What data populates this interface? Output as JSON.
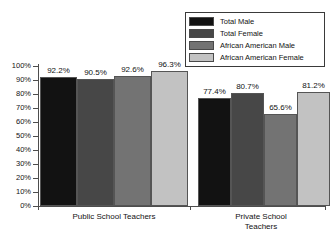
{
  "chart_data": {
    "type": "bar",
    "title": "",
    "subtitle": "",
    "xlabel": "",
    "ylabel": "",
    "ylim": [
      0,
      100
    ],
    "ytick_labels": [
      "100%",
      "90%",
      "80%",
      "70%",
      "60%",
      "50%",
      "40%",
      "30%",
      "20%",
      "10%",
      "0%"
    ],
    "ytick_values": [
      100,
      90,
      80,
      70,
      60,
      50,
      40,
      30,
      20,
      10,
      0
    ],
    "grid": false,
    "legend_position": "top-right",
    "categories": [
      "Public School Teachers",
      "Private School\nTeachers"
    ],
    "series": [
      {
        "name": "Total Male",
        "color": "#121212",
        "values": [
          92.2,
          77.4
        ],
        "labels": [
          "92.2%",
          "77.4%"
        ]
      },
      {
        "name": "Total Female",
        "color": "#474747",
        "values": [
          90.5,
          80.7
        ],
        "labels": [
          "90.5%",
          "80.7%"
        ]
      },
      {
        "name": "African American Male",
        "color": "#737373",
        "values": [
          92.6,
          65.6
        ],
        "labels": [
          "92.6%",
          "65.6%"
        ]
      },
      {
        "name": "African American Female",
        "color": "#c2c2c2",
        "values": [
          96.3,
          81.2
        ],
        "labels": [
          "96.3%",
          "81.2%"
        ]
      }
    ]
  },
  "legend": {
    "items": [
      {
        "label": "Total Male",
        "color": "#121212"
      },
      {
        "label": "Total Female",
        "color": "#474747"
      },
      {
        "label": "African American Male",
        "color": "#737373"
      },
      {
        "label": "African American Female",
        "color": "#c2c2c2"
      }
    ]
  },
  "axis": {
    "y_labels": [
      "100%",
      "90%",
      "80%",
      "70%",
      "60%",
      "50%",
      "40%",
      "30%",
      "20%",
      "10%",
      "0%"
    ]
  },
  "categories": {
    "group1": "Public School Teachers",
    "group2": "Private School\nTeachers"
  }
}
